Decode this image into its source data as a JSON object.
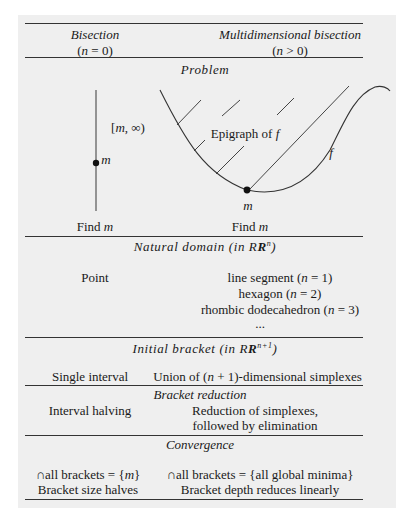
{
  "header": {
    "col1_title": "Bisection",
    "col1_sub": "(n = 0)",
    "col2_title": "Multidimensional bisection",
    "col2_sub": "(n > 0)"
  },
  "sections": {
    "problem": {
      "title": "Problem",
      "left_interval_label": "[m, ∞)",
      "left_point_label": "m",
      "epigraph_label": "Epigraph of f",
      "curve_label": "f",
      "minimum_label": "m",
      "col1": "Find m",
      "col2": "Find m"
    },
    "natural_domain": {
      "title": "Natural domain (in R",
      "title_sup": "n",
      "title_end": ")",
      "col1": "Point",
      "col2_lines": [
        "line segment (n = 1)",
        "hexagon (n = 2)",
        "rhombic dodecahedron (n = 3)",
        "..."
      ]
    },
    "initial_bracket": {
      "title": "Initial bracket (in R",
      "title_sup": "n+1",
      "title_end": ")",
      "col1": "Single interval",
      "col2": "Union of (n + 1)-dimensional simplexes"
    },
    "bracket_reduction": {
      "title": "Bracket reduction",
      "col1": "Interval halving",
      "col2_lines": [
        "Reduction of simplexes,",
        "followed by elimination"
      ]
    },
    "convergence": {
      "title": "Convergence",
      "col1_lines": [
        "∩all brackets = {m}",
        "Bracket size halves"
      ],
      "col2_lines": [
        "∩all brackets = {all global minima}",
        "Bracket depth reduces linearly"
      ]
    }
  }
}
